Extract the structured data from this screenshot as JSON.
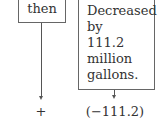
{
  "diagram": {
    "left_box": {
      "text": "then"
    },
    "right_box": {
      "text": "Decreased\nby\n111.2\nmillion\ngallons."
    },
    "left_result": {
      "text": "+"
    },
    "right_result": {
      "text": "(−111.2)"
    }
  }
}
